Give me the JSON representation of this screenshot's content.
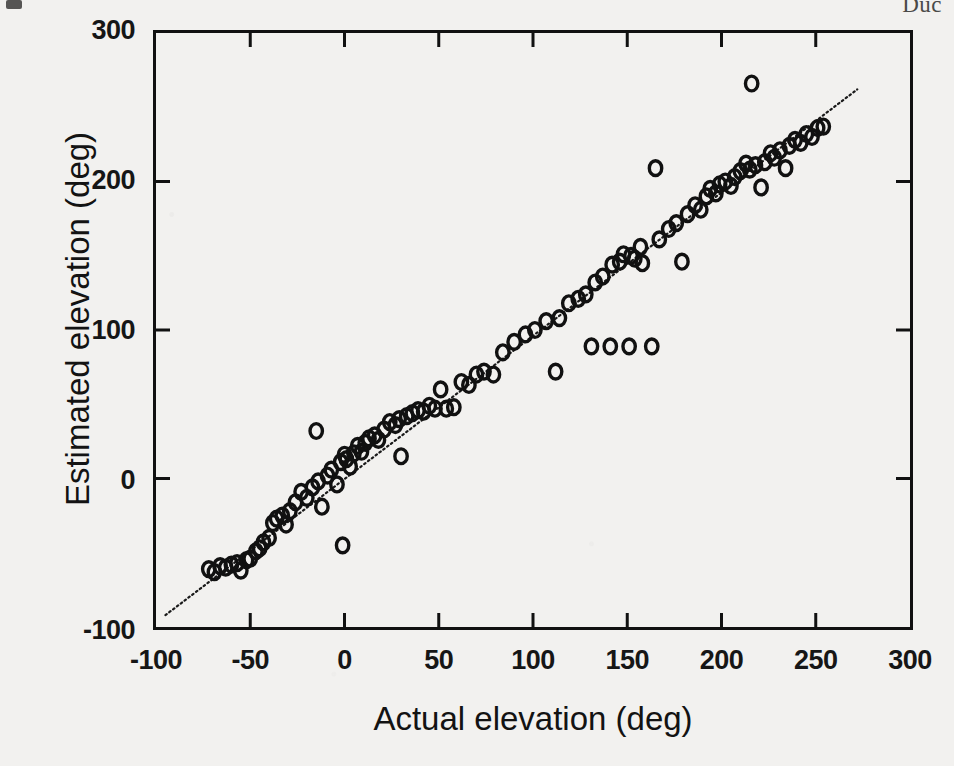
{
  "figure": {
    "header_fragment": "Duc",
    "background_color": "#f2f1ef",
    "ink_color": "#111111"
  },
  "chart_data": {
    "type": "scatter",
    "title": "",
    "xlabel": "Actual elevation  (deg)",
    "ylabel": "Estimated elevation  (deg)",
    "xlim": [
      -100,
      300
    ],
    "ylim": [
      -100,
      300
    ],
    "xticks": [
      -100,
      -50,
      0,
      50,
      100,
      150,
      200,
      250,
      300
    ],
    "xticklabels": [
      "-100",
      "-50",
      "0",
      "50",
      "100",
      "150",
      "200",
      "250",
      "300"
    ],
    "yticks": [
      -100,
      0,
      100,
      200,
      300
    ],
    "yticklabels": [
      "-100",
      "0",
      "100",
      "200",
      "300"
    ],
    "grid": false,
    "legend": null,
    "marker": "open-circle",
    "marker_size": 13,
    "reference_line": {
      "style": "dotted",
      "label": "identity line (y = x)",
      "x": [
        -95,
        272
      ],
      "y": [
        -92,
        262
      ]
    },
    "series": [
      {
        "name": "Elevation estimates",
        "points": [
          [
            -72,
            -61
          ],
          [
            -69,
            -63
          ],
          [
            -66,
            -59
          ],
          [
            -63,
            -60
          ],
          [
            -60,
            -58
          ],
          [
            -57,
            -57
          ],
          [
            -55,
            -62
          ],
          [
            -52,
            -55
          ],
          [
            -50,
            -54
          ],
          [
            -47,
            -49
          ],
          [
            -45,
            -47
          ],
          [
            -43,
            -43
          ],
          [
            -40,
            -40
          ],
          [
            -38,
            -30
          ],
          [
            -36,
            -27
          ],
          [
            -33,
            -25
          ],
          [
            -31,
            -31
          ],
          [
            -29,
            -22
          ],
          [
            -26,
            -16
          ],
          [
            -23,
            -9
          ],
          [
            -20,
            -13
          ],
          [
            -17,
            -6
          ],
          [
            -15,
            32
          ],
          [
            -14,
            -2
          ],
          [
            -12,
            -19
          ],
          [
            -9,
            2
          ],
          [
            -7,
            6
          ],
          [
            -4,
            -4
          ],
          [
            -2,
            11
          ],
          [
            -1,
            -45
          ],
          [
            0,
            16
          ],
          [
            1,
            13
          ],
          [
            3,
            8
          ],
          [
            5,
            17
          ],
          [
            7,
            22
          ],
          [
            9,
            18
          ],
          [
            11,
            24
          ],
          [
            13,
            27
          ],
          [
            16,
            29
          ],
          [
            18,
            26
          ],
          [
            21,
            33
          ],
          [
            24,
            38
          ],
          [
            27,
            36
          ],
          [
            29,
            40
          ],
          [
            30,
            15
          ],
          [
            33,
            42
          ],
          [
            36,
            44
          ],
          [
            39,
            46
          ],
          [
            42,
            45
          ],
          [
            45,
            49
          ],
          [
            48,
            47
          ],
          [
            51,
            60
          ],
          [
            54,
            47
          ],
          [
            58,
            48
          ],
          [
            62,
            65
          ],
          [
            66,
            63
          ],
          [
            70,
            70
          ],
          [
            74,
            72
          ],
          [
            79,
            70
          ],
          [
            84,
            85
          ],
          [
            90,
            92
          ],
          [
            96,
            97
          ],
          [
            101,
            100
          ],
          [
            107,
            106
          ],
          [
            112,
            72
          ],
          [
            114,
            108
          ],
          [
            119,
            118
          ],
          [
            124,
            121
          ],
          [
            128,
            124
          ],
          [
            131,
            89
          ],
          [
            133,
            132
          ],
          [
            137,
            136
          ],
          [
            141,
            89
          ],
          [
            142,
            144
          ],
          [
            146,
            146
          ],
          [
            148,
            151
          ],
          [
            151,
            89
          ],
          [
            152,
            150
          ],
          [
            154,
            148
          ],
          [
            157,
            156
          ],
          [
            158,
            145
          ],
          [
            163,
            89
          ],
          [
            165,
            209
          ],
          [
            167,
            161
          ],
          [
            172,
            168
          ],
          [
            176,
            172
          ],
          [
            179,
            146
          ],
          [
            182,
            178
          ],
          [
            186,
            184
          ],
          [
            189,
            181
          ],
          [
            192,
            190
          ],
          [
            194,
            195
          ],
          [
            197,
            192
          ],
          [
            199,
            198
          ],
          [
            202,
            200
          ],
          [
            205,
            197
          ],
          [
            207,
            203
          ],
          [
            210,
            207
          ],
          [
            213,
            212
          ],
          [
            215,
            208
          ],
          [
            216,
            266
          ],
          [
            218,
            211
          ],
          [
            221,
            196
          ],
          [
            223,
            213
          ],
          [
            226,
            219
          ],
          [
            228,
            216
          ],
          [
            231,
            221
          ],
          [
            234,
            209
          ],
          [
            236,
            224
          ],
          [
            239,
            228
          ],
          [
            242,
            226
          ],
          [
            245,
            232
          ],
          [
            248,
            230
          ],
          [
            251,
            236
          ],
          [
            254,
            237
          ]
        ]
      }
    ]
  }
}
